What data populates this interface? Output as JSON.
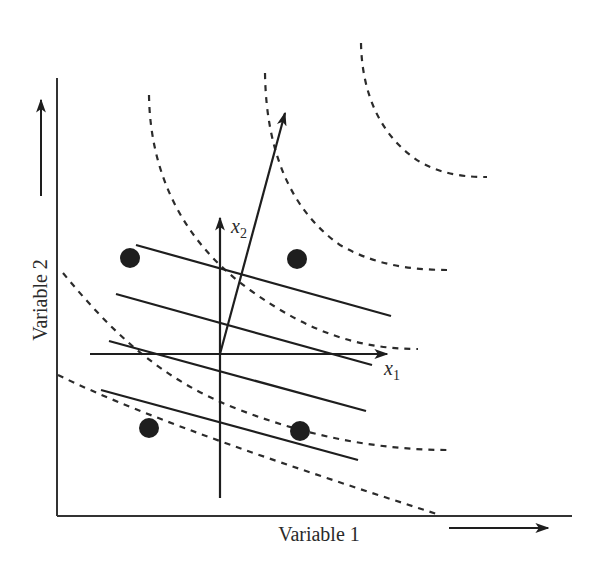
{
  "figure": {
    "x_axis_label": "Variable 1",
    "y_axis_label": "Variable 2",
    "new_axis_1_label": "x",
    "new_axis_1_subscript": "1",
    "new_axis_2_label": "x",
    "new_axis_2_subscript": "2",
    "colors": {
      "ink": "#1e1e1e",
      "dashed": "#2b2b2b",
      "background": "#ffffff"
    },
    "points": [
      {
        "x": 130,
        "y": 258
      },
      {
        "x": 297,
        "y": 259
      },
      {
        "x": 149,
        "y": 428
      },
      {
        "x": 300,
        "y": 431
      }
    ],
    "parallel_lines_count": 4,
    "dashed_contours_count": 5
  }
}
